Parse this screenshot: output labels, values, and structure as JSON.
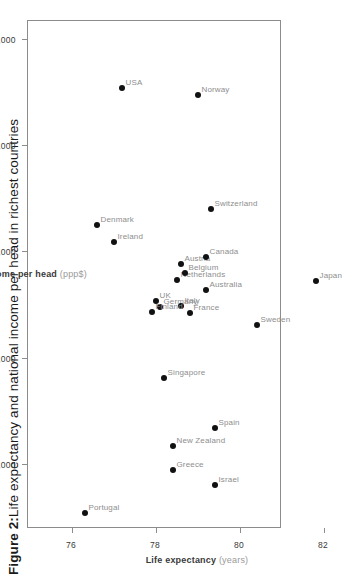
{
  "figure": {
    "caption_prefix": "Figure 2:",
    "caption_text": " Life expectancy and national income per head in richest countries"
  },
  "chart_data": {
    "type": "scatter",
    "title": "Figure 2: Life expectancy and national income per head in richest countries",
    "xlabel": "Life expectancy",
    "xunit": "(years)",
    "ylabel": "Gross national income per head",
    "yunit": "(ppp$)",
    "xlim": [
      75.5,
      82.5
    ],
    "ylim": [
      17000,
      40500
    ],
    "xticks": [
      76,
      78,
      80,
      82
    ],
    "xticklabels": [
      "76",
      "78",
      "80",
      "82"
    ],
    "yticks": [
      20000,
      25000,
      30000,
      35000,
      40000
    ],
    "yticklabels": [
      "20,000",
      "25,000",
      "30,000",
      "35,000",
      "40,000"
    ],
    "grid": false,
    "legend": null,
    "orientation": "page-rotated-90-ccw",
    "marker_color": "#111111",
    "frame_color": "#8c8c8c",
    "label_color": "#8e8e8e",
    "points": [
      {
        "name": "Portugal",
        "life_expectancy": 76.3,
        "income": 17750
      },
      {
        "name": "Israel",
        "life_expectancy": 79.4,
        "income": 19050
      },
      {
        "name": "Greece",
        "life_expectancy": 78.4,
        "income": 19750
      },
      {
        "name": "New Zealand",
        "life_expectancy": 78.4,
        "income": 20900
      },
      {
        "name": "Spain",
        "life_expectancy": 79.4,
        "income": 21750
      },
      {
        "name": "Singapore",
        "life_expectancy": 78.2,
        "income": 24100
      },
      {
        "name": "Sweden",
        "life_expectancy": 80.4,
        "income": 26600
      },
      {
        "name": "France",
        "life_expectancy": 78.8,
        "income": 27150
      },
      {
        "name": "Germany",
        "life_expectancy": 78.1,
        "income": 27450
      },
      {
        "name": "Italy",
        "life_expectancy": 78.6,
        "income": 27500
      },
      {
        "name": "Finland",
        "life_expectancy": 77.9,
        "income": 27200
      },
      {
        "name": "UK",
        "life_expectancy": 78.0,
        "income": 27700
      },
      {
        "name": "Australia",
        "life_expectancy": 79.2,
        "income": 28250
      },
      {
        "name": "Japan",
        "life_expectancy": 81.8,
        "income": 28650
      },
      {
        "name": "Netherlands",
        "life_expectancy": 78.5,
        "income": 28700
      },
      {
        "name": "Belgium",
        "life_expectancy": 78.7,
        "income": 29050
      },
      {
        "name": "Austria",
        "life_expectancy": 78.6,
        "income": 29450
      },
      {
        "name": "Canada",
        "life_expectancy": 79.2,
        "income": 29800
      },
      {
        "name": "Ireland",
        "life_expectancy": 77.0,
        "income": 30500
      },
      {
        "name": "Denmark",
        "life_expectancy": 76.6,
        "income": 31300
      },
      {
        "name": "Switzerland",
        "life_expectancy": 79.3,
        "income": 32050
      },
      {
        "name": "USA",
        "life_expectancy": 77.2,
        "income": 37750
      },
      {
        "name": "Norway",
        "life_expectancy": 79.0,
        "income": 37400
      }
    ]
  }
}
